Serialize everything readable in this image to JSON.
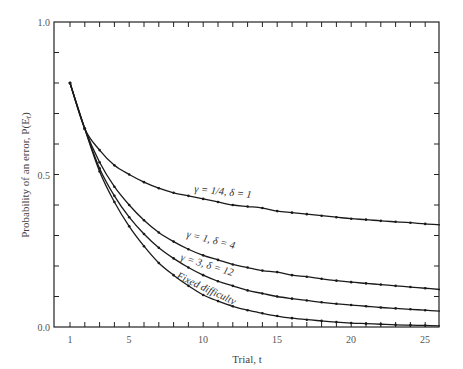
{
  "chart_data": {
    "type": "line",
    "title": "",
    "xlabel": "Trial, t",
    "ylabel": "Probability of an error, P(E_t)",
    "xlim": [
      0,
      26
    ],
    "ylim": [
      0.0,
      1.0
    ],
    "x_ticks": [
      1,
      5,
      10,
      15,
      20,
      25
    ],
    "y_ticks": [
      "0.0",
      "0.5",
      "1.0"
    ],
    "grid": false,
    "legend": "inline labels on curves",
    "x": [
      1,
      2,
      3,
      4,
      5,
      6,
      7,
      8,
      9,
      10,
      11,
      12,
      13,
      14,
      15,
      16,
      17,
      18,
      19,
      20,
      21,
      22,
      23,
      24,
      25,
      26
    ],
    "series": [
      {
        "name": "γ = 1/4, δ = 1",
        "values": [
          0.8,
          0.65,
          0.58,
          0.53,
          0.5,
          0.475,
          0.455,
          0.44,
          0.43,
          0.42,
          0.41,
          0.4,
          0.395,
          0.39,
          0.38,
          0.375,
          0.37,
          0.365,
          0.36,
          0.355,
          0.352,
          0.348,
          0.345,
          0.342,
          0.338,
          0.335
        ]
      },
      {
        "name": "γ = 1, δ = 4",
        "values": [
          0.8,
          0.65,
          0.54,
          0.46,
          0.4,
          0.35,
          0.31,
          0.28,
          0.255,
          0.235,
          0.22,
          0.205,
          0.195,
          0.185,
          0.18,
          0.17,
          0.165,
          0.158,
          0.152,
          0.147,
          0.143,
          0.139,
          0.135,
          0.131,
          0.127,
          0.123
        ]
      },
      {
        "name": "γ = 3, δ = 12",
        "values": [
          0.8,
          0.65,
          0.52,
          0.43,
          0.36,
          0.305,
          0.26,
          0.225,
          0.195,
          0.17,
          0.15,
          0.135,
          0.12,
          0.11,
          0.1,
          0.093,
          0.087,
          0.081,
          0.076,
          0.072,
          0.068,
          0.064,
          0.061,
          0.058,
          0.055,
          0.052
        ]
      },
      {
        "name": "Fixed difficulty",
        "values": [
          0.8,
          0.65,
          0.51,
          0.41,
          0.33,
          0.265,
          0.21,
          0.17,
          0.135,
          0.105,
          0.085,
          0.068,
          0.055,
          0.045,
          0.036,
          0.029,
          0.024,
          0.02,
          0.016,
          0.013,
          0.011,
          0.009,
          0.007,
          0.006,
          0.005,
          0.004
        ]
      }
    ]
  },
  "labels": {
    "xlabel": "Trial, t",
    "ylabel": "Probability of an error, P(E",
    "ylabel_sub": "t",
    "ylabel_end": ")",
    "y_tick_0": "0.0",
    "y_tick_05": "0.5",
    "y_tick_1": "1.0",
    "x_tick_1": "1",
    "x_tick_5": "5",
    "x_tick_10": "10",
    "x_tick_15": "15",
    "x_tick_20": "20",
    "x_tick_25": "25",
    "curve_1": "γ = 1/4, δ = 1",
    "curve_2": "γ = 1, δ = 4",
    "curve_3": "γ = 3, δ = 12",
    "curve_4": "Fixed difficulty"
  }
}
